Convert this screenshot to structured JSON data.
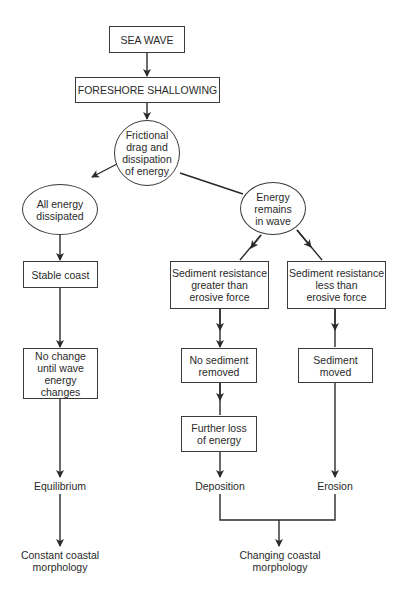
{
  "diagram": {
    "type": "flowchart",
    "nodes": {
      "sea_wave": "SEA WAVE",
      "foreshore": "FORESHORE SHALLOWING",
      "friction_l1": "Frictional",
      "friction_l2": "drag and",
      "friction_l3": "dissipation",
      "friction_l4": "of energy",
      "all_dissipated_l1": "All energy",
      "all_dissipated_l2": "dissipated",
      "energy_remains_l1": "Energy remains",
      "energy_remains_l2": "in wave",
      "stable_coast": "Stable coast",
      "sed_greater_l1": "Sediment resistance",
      "sed_greater_l2": "greater than",
      "sed_greater_l3": "erosive force",
      "sed_less_l1": "Sediment resistance",
      "sed_less_l2": "less than",
      "sed_less_l3": "erosive force",
      "no_change_l1": "No change",
      "no_change_l2": "until wave",
      "no_change_l3": "energy changes",
      "no_sediment_l1": "No sediment",
      "no_sediment_l2": "removed",
      "sediment_moved_l1": "Sediment",
      "sediment_moved_l2": "moved",
      "further_loss_l1": "Further loss",
      "further_loss_l2": "of energy",
      "equilibrium": "Equilibrium",
      "deposition": "Deposition",
      "erosion": "Erosion",
      "constant_l1": "Constant coastal",
      "constant_l2": "morphology",
      "changing_l1": "Changing coastal",
      "changing_l2": "morphology"
    },
    "edges": [
      [
        "SEA WAVE",
        "FORESHORE SHALLOWING"
      ],
      [
        "FORESHORE SHALLOWING",
        "Frictional drag and dissipation of energy"
      ],
      [
        "Frictional drag and dissipation of energy",
        "All energy dissipated"
      ],
      [
        "Frictional drag and dissipation of energy",
        "Energy remains in wave"
      ],
      [
        "All energy dissipated",
        "Stable coast"
      ],
      [
        "Stable coast",
        "No change until wave energy changes"
      ],
      [
        "No change until wave energy changes",
        "Equilibrium"
      ],
      [
        "Equilibrium",
        "Constant coastal morphology"
      ],
      [
        "Energy remains in wave",
        "Sediment resistance greater than erosive force"
      ],
      [
        "Energy remains in wave",
        "Sediment resistance less than erosive force"
      ],
      [
        "Sediment resistance greater than erosive force",
        "No sediment removed"
      ],
      [
        "No sediment removed",
        "Further loss of energy"
      ],
      [
        "Further loss of energy",
        "Deposition"
      ],
      [
        "Sediment resistance less than erosive force",
        "Sediment moved"
      ],
      [
        "Sediment moved",
        "Erosion"
      ],
      [
        "Deposition",
        "Changing coastal morphology"
      ],
      [
        "Erosion",
        "Changing coastal morphology"
      ]
    ],
    "colors": {
      "line": "#2a2a2a",
      "text": "#2a2a2a",
      "background": "#ffffff"
    }
  }
}
